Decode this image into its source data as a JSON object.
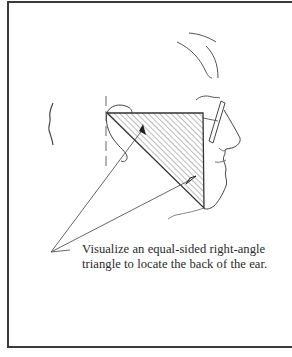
{
  "illustration": {
    "subject": "profile-head-sketch",
    "ink_color": "#333333",
    "hatch_color": "#555555"
  },
  "caption": {
    "line1": "Visualize an equal-sided right-angle",
    "line2": "triangle to locate the back of the ear."
  }
}
